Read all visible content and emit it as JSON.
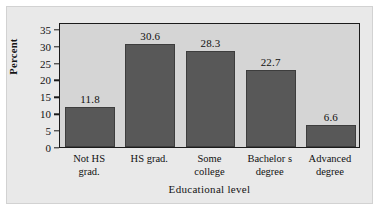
{
  "chart_data": {
    "type": "bar",
    "title": "",
    "subtitle": "",
    "xlabel": "Educational level",
    "ylabel": "Percent",
    "categories": [
      "Not HS grad.",
      "HS grad.",
      "Some college",
      "Bachelor s degree",
      "Advanced degree"
    ],
    "category_lines": [
      [
        "Not HS",
        "grad."
      ],
      [
        "HS grad.",
        ""
      ],
      [
        "Some",
        "college"
      ],
      [
        "Bachelor s",
        "degree"
      ],
      [
        "Advanced",
        "degree"
      ]
    ],
    "values": [
      11.8,
      30.6,
      28.3,
      22.7,
      6.6
    ],
    "value_labels": [
      "11.8",
      "30.6",
      "28.3",
      "22.7",
      "6.6"
    ],
    "ylim": [
      0,
      37
    ],
    "yticks": [
      0,
      5,
      10,
      15,
      20,
      25,
      30,
      35
    ],
    "ytick_labels": [
      "0",
      "5",
      "10",
      "15",
      "20",
      "25",
      "30",
      "35"
    ],
    "grid": false,
    "legend": false,
    "bar_color": "#585858",
    "plot_background": "#d5d5d5",
    "figure_background": "#e9e9e9",
    "axis_color": "#1b1b1b"
  }
}
